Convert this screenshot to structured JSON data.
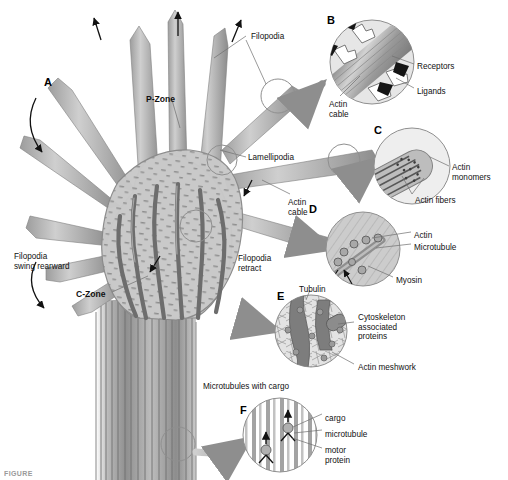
{
  "figure": {
    "caption_fragment": "FIGURE",
    "background": "#ffffff"
  },
  "colors": {
    "cell_body_fill": "#c9c9c9",
    "cell_body_stroke": "#8a8a8a",
    "actin_cable_dark": "#6d6d6d",
    "filopodia_fill": "#b4b4b4",
    "axon_stripe": "#7a7a7a",
    "inset_circle_stroke": "#8f8f8f",
    "inset_fill_light": "#d7d7d7",
    "arrow_gray": "#a0a0a0",
    "text": "#111111"
  },
  "main_labels": [
    {
      "id": "A",
      "text": "A",
      "x": 44,
      "y": 76,
      "bold": true,
      "letter": true
    },
    {
      "id": "p-zone",
      "text": "P-Zone",
      "x": 146,
      "y": 95,
      "bold": true
    },
    {
      "id": "c-zone",
      "text": "C-Zone",
      "x": 76,
      "y": 290,
      "bold": true
    },
    {
      "id": "filopodia-top",
      "text": "Filopodia",
      "x": 251,
      "y": 32,
      "bold": false
    },
    {
      "id": "lamellipodia",
      "text": "Lamellipodia",
      "x": 248,
      "y": 153,
      "bold": false
    },
    {
      "id": "actin-cable-main",
      "text": "Actin\ncable",
      "x": 288,
      "y": 198,
      "bold": false
    },
    {
      "id": "filopodia-retract",
      "text": "Filopodia\nretract",
      "x": 238,
      "y": 254,
      "bold": false
    },
    {
      "id": "filopodia-swing",
      "text": "Filopodia\nswing rearward",
      "x": 14,
      "y": 252,
      "bold": false
    },
    {
      "id": "mt-cargo-title",
      "text": "Microtubules with cargo",
      "x": 203,
      "y": 382,
      "bold": false
    }
  ],
  "panels": [
    {
      "id": "B",
      "letter": "B",
      "letter_x": 327,
      "letter_y": 14,
      "cx": 372,
      "cy": 62,
      "r": 42,
      "subject": "filopodium tip with receptors and ligands",
      "labels": [
        {
          "id": "receptors",
          "text": "Receptors",
          "x": 417,
          "y": 62
        },
        {
          "id": "ligands",
          "text": "Ligands",
          "x": 417,
          "y": 87
        },
        {
          "id": "actin-cable",
          "text": "Actin\ncable",
          "x": 329,
          "y": 100
        }
      ]
    },
    {
      "id": "C",
      "letter": "C",
      "letter_x": 374,
      "letter_y": 124,
      "cx": 412,
      "cy": 166,
      "r": 38,
      "subject": "actin fiber bundle tip with monomers",
      "labels": [
        {
          "id": "actin-monomers",
          "text": "Actin\nmonomers",
          "x": 452,
          "y": 163
        },
        {
          "id": "actin-fibers",
          "text": "Actin fibers",
          "x": 415,
          "y": 196
        }
      ]
    },
    {
      "id": "D",
      "letter": "D",
      "letter_x": 309,
      "letter_y": 203,
      "cx": 363,
      "cy": 249,
      "r": 37,
      "subject": "actin meshwork with microtubule and myosin",
      "labels": [
        {
          "id": "actin",
          "text": "Actin",
          "x": 414,
          "y": 231
        },
        {
          "id": "microtubule",
          "text": "Microtubule",
          "x": 414,
          "y": 243
        },
        {
          "id": "myosin",
          "text": "Myosin",
          "x": 396,
          "y": 276
        }
      ]
    },
    {
      "id": "E",
      "letter": "E",
      "letter_x": 277,
      "letter_y": 290,
      "cx": 311,
      "cy": 331,
      "r": 36,
      "subject": "tubulin bands with cytoskeleton associated proteins",
      "labels": [
        {
          "id": "tubulin",
          "text": "Tubulin",
          "x": 299,
          "y": 285
        },
        {
          "id": "csk-proteins",
          "text": "Cytoskeleton\nassociated\nproteins",
          "x": 358,
          "y": 313
        },
        {
          "id": "actin-meshwork",
          "text": "Actin meshwork",
          "x": 358,
          "y": 363
        }
      ]
    },
    {
      "id": "F",
      "letter": "F",
      "letter_x": 240,
      "letter_y": 404,
      "cx": 280,
      "cy": 435,
      "r": 37,
      "subject": "microtubules transporting cargo via motor proteins",
      "labels": [
        {
          "id": "cargo",
          "text": "cargo",
          "x": 325,
          "y": 414
        },
        {
          "id": "microtubule-f",
          "text": "microtubule",
          "x": 325,
          "y": 430
        },
        {
          "id": "motor-protein",
          "text": "motor\nprotein",
          "x": 325,
          "y": 446
        }
      ]
    }
  ],
  "chart_data": {
    "type": "diagram",
    "regions": [
      {
        "name": "P-Zone",
        "description": "peripheral zone rich in actin filopodia and lamellipodia"
      },
      {
        "name": "C-Zone",
        "description": "central zone containing microtubules and organelles"
      }
    ],
    "motion_annotations": [
      "Filopodia extend outward (upward arrows)",
      "Filopodia swing rearward (curved arrow A)",
      "Filopodia retract"
    ]
  }
}
